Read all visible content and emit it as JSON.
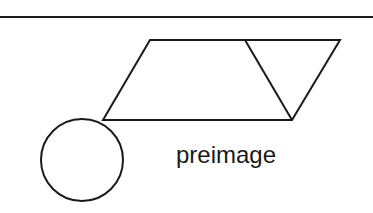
{
  "diagram": {
    "label": "preimage",
    "colors": {
      "stroke": "#1a1a1a",
      "background": "#ffffff"
    },
    "shapes": {
      "top_rule": {
        "x1": 0,
        "y1": 17,
        "x2": 373,
        "y2": 17
      },
      "parallelogram": [
        [
          150,
          40
        ],
        [
          340,
          40
        ],
        [
          292,
          120
        ],
        [
          103,
          120
        ]
      ],
      "diagonal": {
        "x1": 245,
        "y1": 40,
        "x2": 292,
        "y2": 120
      },
      "circle": {
        "cx": 82,
        "cy": 160,
        "r": 41
      }
    }
  }
}
